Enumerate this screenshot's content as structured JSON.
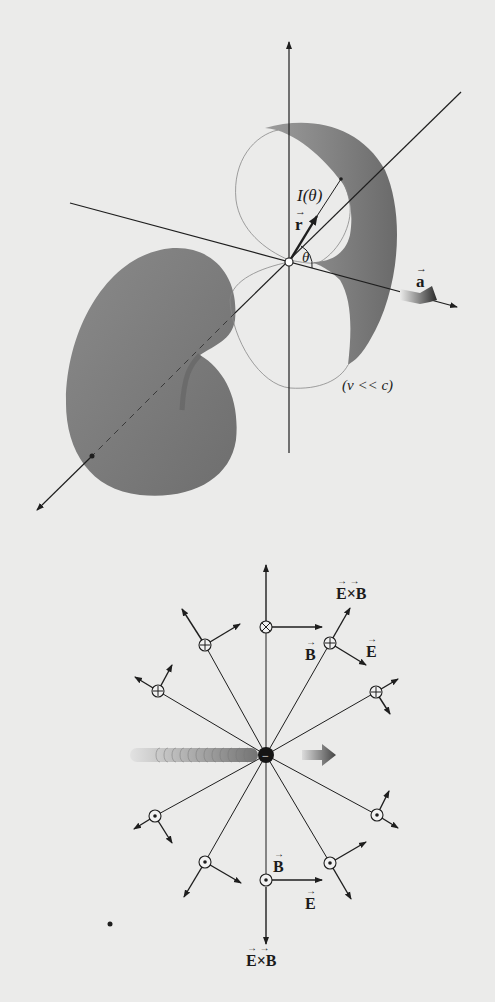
{
  "figure_top": {
    "title": "Larmor radiation pattern of accelerated charge",
    "labels": {
      "intensity": "I(θ)",
      "position_vector": "r",
      "angle": "θ",
      "acceleration": "a",
      "condition": "(v << c)"
    },
    "colors": {
      "lobe_fill": "#7a7a7a",
      "line": "#1e1e1e",
      "background": "#ebebea"
    }
  },
  "figure_bottom": {
    "title": "Fields of a decelerating negative charge",
    "charge_symbol": "−",
    "labels": {
      "poynting_top": "E×B",
      "b_top": "B",
      "e_top": "E",
      "b_bottom": "B",
      "e_bottom": "E",
      "poynting_bottom": "E×B"
    },
    "field_markers": {
      "into_page": "⊗",
      "out_of_page": "⊙"
    },
    "colors": {
      "line": "#1e1e1e",
      "motion_trail": "#9a9a9a"
    }
  }
}
